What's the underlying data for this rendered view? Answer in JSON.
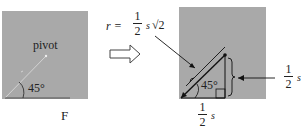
{
  "left_figure": {
    "pivot_label": "pivot",
    "angle_label": "45°",
    "force_label": "F"
  },
  "arrow": {
    "icon": "hollow-right-arrow"
  },
  "right_figure": {
    "angle_label": "45°",
    "r_equation": {
      "lhs": "r =",
      "numerator": "1",
      "denominator": "2",
      "tail": "s",
      "sqrt": "√2"
    },
    "vertical_leg": {
      "numerator": "1",
      "denominator": "2",
      "tail": "s"
    },
    "horizontal_leg": {
      "numerator": "1",
      "denominator": "2",
      "tail": "s"
    }
  },
  "colors": {
    "panel": "#a9a9a9",
    "ink": "#222222"
  }
}
